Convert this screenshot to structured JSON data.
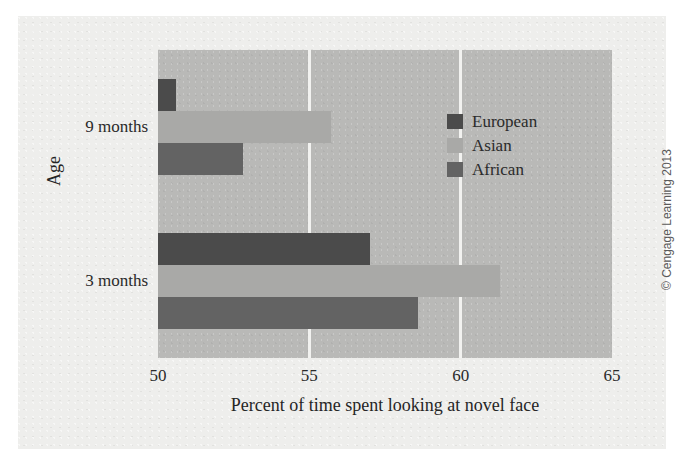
{
  "chart_data": {
    "type": "bar",
    "orientation": "horizontal",
    "title": "",
    "xlabel": "Percent of time spent looking at novel face",
    "ylabel": "Age",
    "categories": [
      "9 months",
      "3 months"
    ],
    "xlim": [
      50,
      65
    ],
    "xticks": [
      50,
      55,
      60,
      65
    ],
    "xtick_labels": [
      "50",
      "55",
      "60",
      "65"
    ],
    "grid": true,
    "grid_axis": "x",
    "legend_position": "inside-upper-right",
    "series": [
      {
        "name": "European",
        "color": "#4b4b4b",
        "values": [
          50.6,
          57.0
        ]
      },
      {
        "name": "Asian",
        "color": "#a9a9a7",
        "values": [
          55.7,
          61.3
        ]
      },
      {
        "name": "African",
        "color": "#636363",
        "values": [
          52.8,
          58.6
        ]
      }
    ]
  },
  "legend": {
    "items": [
      {
        "label": "European",
        "color": "#4b4b4b"
      },
      {
        "label": "Asian",
        "color": "#a9a9a7"
      },
      {
        "label": "African",
        "color": "#636363"
      }
    ]
  },
  "axes": {
    "x_tick_labels": [
      "50",
      "55",
      "60",
      "65"
    ],
    "y_tick_labels": [
      "9 months",
      "3 months"
    ],
    "x_title": "Percent of time spent looking at novel face",
    "y_title": "Age"
  },
  "footer": {
    "copyright": "© Cengage Learning 2013"
  },
  "colors": {
    "plot_background": "#b9b9b7",
    "paper_background": "#eeeeec",
    "gridline": "#f2f2f0",
    "european": "#4b4b4b",
    "asian": "#a9a9a7",
    "african": "#636363"
  }
}
